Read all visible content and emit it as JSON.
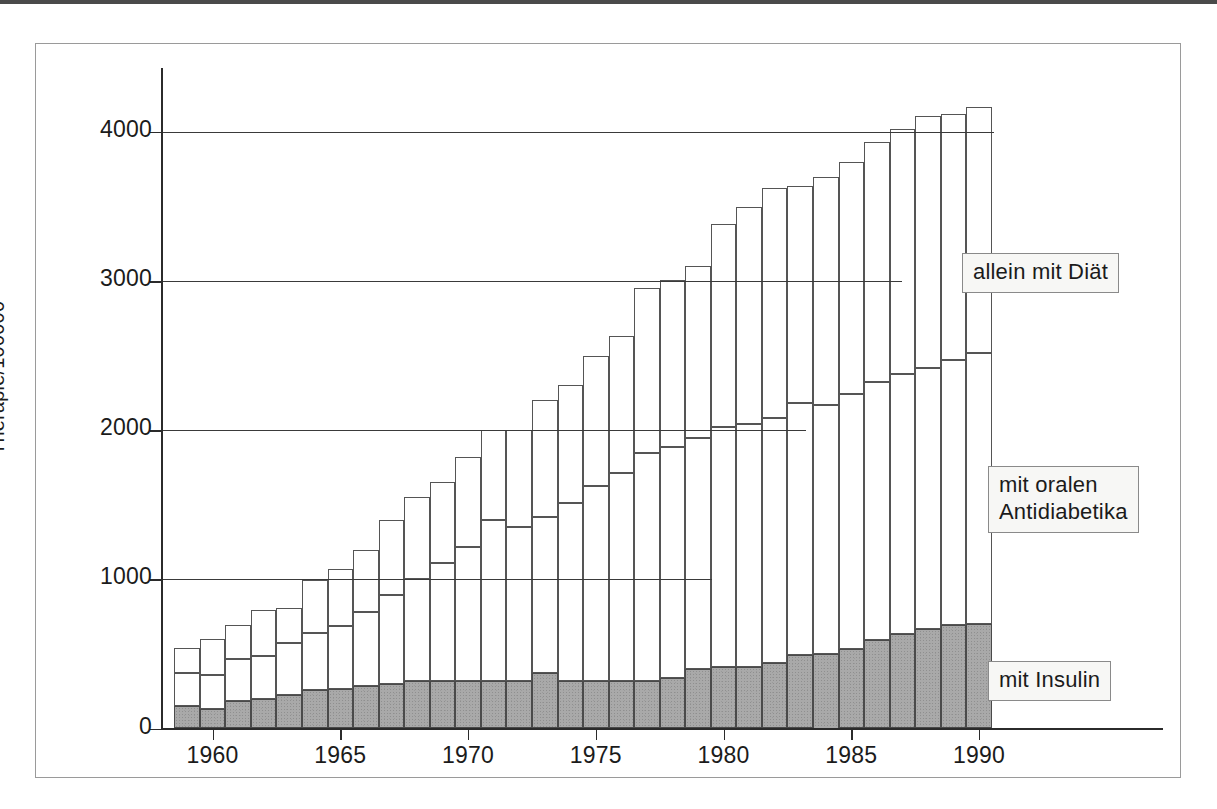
{
  "figure": {
    "y_axis_title": "Therapie/100000",
    "y_ticks": [
      "0",
      "1000",
      "2000",
      "3000",
      "4000"
    ],
    "x_ticks": [
      "1960",
      "1965",
      "1970",
      "1975",
      "1980",
      "1985",
      "1990"
    ],
    "annotations": {
      "diet": "allein mit Diät",
      "oral": "mit oralen\nAntidiabetika",
      "insulin": "mit Insulin"
    },
    "colors": {
      "insulin_fill": "#a9a9a9",
      "other_fill": "#ffffff",
      "line": "#4a4a4a",
      "rule": "#4a4a4a"
    }
  },
  "chart_data": {
    "type": "bar",
    "stacked": true,
    "title": "",
    "xlabel": "",
    "ylabel": "Therapie/100000",
    "ylim": [
      0,
      4400
    ],
    "xlim": [
      1958.5,
      1991.5
    ],
    "ygrid": true,
    "xgrid": false,
    "legend_position": "inline-callouts",
    "ytick_values": [
      0,
      1000,
      2000,
      3000,
      4000
    ],
    "xtick_values": [
      1960,
      1965,
      1970,
      1975,
      1980,
      1985,
      1990
    ],
    "categories": [
      1959,
      1960,
      1961,
      1962,
      1963,
      1964,
      1965,
      1966,
      1967,
      1968,
      1969,
      1970,
      1971,
      1972,
      1973,
      1974,
      1975,
      1976,
      1977,
      1978,
      1979,
      1980,
      1981,
      1982,
      1983,
      1984,
      1985,
      1986,
      1987,
      1988,
      1989,
      1990
    ],
    "series": [
      {
        "name": "mit Insulin",
        "values": [
          150,
          130,
          185,
          195,
          225,
          255,
          265,
          285,
          300,
          320,
          320,
          320,
          320,
          320,
          370,
          320,
          320,
          320,
          320,
          340,
          400,
          410,
          415,
          440,
          495,
          500,
          535,
          595,
          635,
          665,
          695,
          700
        ]
      },
      {
        "name": "mit oralen Antidiabetika",
        "values": [
          220,
          230,
          280,
          290,
          350,
          385,
          425,
          495,
          595,
          685,
          790,
          900,
          1080,
          1030,
          1045,
          1190,
          1305,
          1390,
          1525,
          1545,
          1545,
          1610,
          1630,
          1645,
          1690,
          1670,
          1705,
          1730,
          1745,
          1755,
          1775,
          1815
        ]
      },
      {
        "name": "allein mit Diät",
        "values": [
          170,
          240,
          230,
          310,
          230,
          355,
          380,
          420,
          505,
          545,
          545,
          600,
          605,
          655,
          785,
          795,
          875,
          920,
          1110,
          1120,
          1155,
          1360,
          1455,
          1540,
          1455,
          1525,
          1560,
          1605,
          1640,
          1690,
          1650,
          1650
        ]
      }
    ],
    "totals": [
      540,
      600,
      695,
      795,
      805,
      995,
      1070,
      1200,
      1400,
      1550,
      1655,
      1820,
      2005,
      2005,
      2200,
      2305,
      2500,
      2630,
      2955,
      3005,
      3100,
      3380,
      3500,
      3625,
      3640,
      3695,
      3800,
      3930,
      4020,
      4110,
      4120,
      4165
    ]
  }
}
